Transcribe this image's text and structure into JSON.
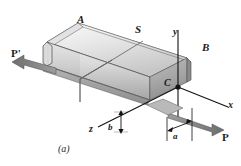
{
  "figure": {
    "caption": "(a)",
    "colors": {
      "line": "#1a1a1a",
      "top_face_light": "#f2f2f2",
      "top_face_dark": "#c9c9c9",
      "front_face_light": "#e8e8e8",
      "front_face_dark": "#a8a8a8",
      "end_face": "#8f8f8f",
      "chamfer": "#bdbdbd",
      "arrow": "#6f6f6f",
      "background": "#ffffff"
    }
  },
  "labels": {
    "point_a": "A",
    "section_s": "S",
    "point_b": "B",
    "point_c": "C",
    "axis_x": "x",
    "axis_y": "y",
    "axis_z": "z",
    "dim_a": "a",
    "dim_b": "b",
    "force_right": "P",
    "force_left": "P'"
  }
}
